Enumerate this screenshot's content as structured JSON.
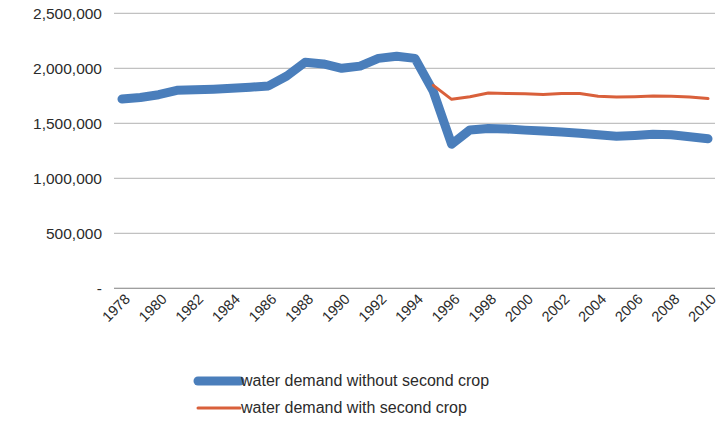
{
  "chart_data": {
    "type": "line",
    "title": "",
    "xlabel": "",
    "ylabel": "",
    "x": [
      1978,
      1979,
      1980,
      1981,
      1982,
      1983,
      1984,
      1985,
      1986,
      1987,
      1988,
      1989,
      1990,
      1991,
      1992,
      1993,
      1994,
      1995,
      1996,
      1997,
      1998,
      1999,
      2000,
      2001,
      2002,
      2003,
      2004,
      2005,
      2006,
      2007,
      2008,
      2009,
      2010
    ],
    "xtick_labels": [
      "1978",
      "1980",
      "1982",
      "1984",
      "1986",
      "1988",
      "1990",
      "1992",
      "1994",
      "1996",
      "1998",
      "2000",
      "2002",
      "2004",
      "2006",
      "2008",
      "2010"
    ],
    "xtick_values": [
      1978,
      1980,
      1982,
      1984,
      1986,
      1988,
      1990,
      1992,
      1994,
      1996,
      1998,
      2000,
      2002,
      2004,
      2006,
      2008,
      2010
    ],
    "ytick_labels": [
      "-",
      "500,000",
      "1,000,000",
      "1,500,000",
      "2,000,000",
      "2,500,000"
    ],
    "ytick_values": [
      0,
      500000,
      1000000,
      1500000,
      2000000,
      2500000
    ],
    "ylim": [
      0,
      2500000
    ],
    "xlim": [
      1978,
      2010
    ],
    "grid": true,
    "legend_position": "bottom",
    "series": [
      {
        "name": "water demand without second crop",
        "color": "#4a7ebb",
        "width": 9,
        "values": [
          1720000,
          1735000,
          1760000,
          1800000,
          1805000,
          1810000,
          1818000,
          1828000,
          1840000,
          1930000,
          2055000,
          2040000,
          2000000,
          2020000,
          2090000,
          2110000,
          2090000,
          1790000,
          1310000,
          1440000,
          1452000,
          1448000,
          1438000,
          1430000,
          1420000,
          1410000,
          1395000,
          1382000,
          1390000,
          1400000,
          1395000,
          1378000,
          1360000
        ]
      },
      {
        "name": "water demand with second crop",
        "color": "#d9603b",
        "width": 3,
        "x_start": 1995,
        "values": [
          null,
          null,
          null,
          null,
          null,
          null,
          null,
          null,
          null,
          null,
          null,
          null,
          null,
          null,
          null,
          null,
          null,
          1845000,
          1718000,
          1742000,
          1775000,
          1772000,
          1768000,
          1762000,
          1772000,
          1770000,
          1745000,
          1738000,
          1742000,
          1748000,
          1745000,
          1738000,
          1725000
        ]
      }
    ]
  },
  "legend": {
    "items": [
      {
        "label": "water demand without second crop",
        "color": "#4a7ebb",
        "swatch": "thick-line-swatch"
      },
      {
        "label": "water demand with second crop",
        "color": "#d9603b",
        "swatch": "thin-line-swatch"
      }
    ]
  },
  "axes": {
    "y_axis_name": "value-axis",
    "x_axis_name": "category-axis"
  }
}
